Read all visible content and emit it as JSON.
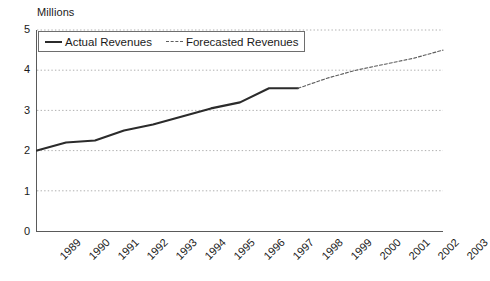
{
  "chart_data": {
    "type": "line",
    "title": "",
    "ylabel": "Millions",
    "xlabel": "",
    "ylim": [
      0,
      5
    ],
    "yticks": [
      "0",
      "1",
      "2",
      "3",
      "4",
      "5"
    ],
    "grid": true,
    "legend_position": "top-left-inside",
    "categories": [
      "1989",
      "1990",
      "1991",
      "1992",
      "1993",
      "1994",
      "1995",
      "1996",
      "1997",
      "1998",
      "1999",
      "2000",
      "2001",
      "2002",
      "2003"
    ],
    "series": [
      {
        "name": "Actual Revenues",
        "style": "solid",
        "color": "#2b2b2b",
        "values": [
          2.0,
          2.2,
          2.25,
          2.5,
          2.65,
          2.85,
          3.05,
          3.2,
          3.55,
          3.55,
          null,
          null,
          null,
          null,
          null
        ]
      },
      {
        "name": "Forecasted Revenues",
        "style": "dashed",
        "color": "#5d5d5d",
        "values": [
          null,
          null,
          null,
          null,
          null,
          null,
          null,
          null,
          null,
          3.55,
          3.8,
          4.0,
          4.15,
          4.3,
          4.5
        ]
      }
    ]
  },
  "legend": {
    "items": [
      {
        "label": "Actual Revenues",
        "style": "solid"
      },
      {
        "label": "Forecasted Revenues",
        "style": "dashed"
      }
    ]
  }
}
